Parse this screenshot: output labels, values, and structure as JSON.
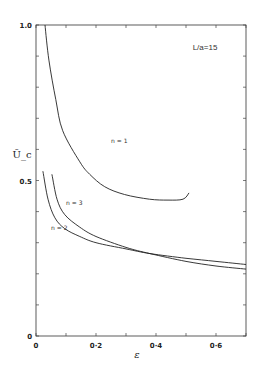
{
  "chart_data": {
    "type": "line",
    "title": "",
    "annotation": "L/a=15",
    "xlabel": "ε",
    "ylabel": "Ū_c",
    "xlim": [
      0,
      0.7
    ],
    "ylim": [
      0,
      1.0
    ],
    "grid": false,
    "legend": "inline curve labels",
    "x_ticks": [
      {
        "value": 0,
        "label": "0"
      },
      {
        "value": 0.2,
        "label": "0·2"
      },
      {
        "value": 0.4,
        "label": "0·4"
      },
      {
        "value": 0.6,
        "label": "0·6"
      }
    ],
    "y_ticks": [
      {
        "value": 0,
        "label": "0"
      },
      {
        "value": 0.5,
        "label": "0.5"
      },
      {
        "value": 1.0,
        "label": "1.0"
      }
    ],
    "series": [
      {
        "name": "n=1",
        "label": "n = 1",
        "label_pos": [
          0.25,
          0.62
        ],
        "x": [
          0.03,
          0.043,
          0.066,
          0.089,
          0.146,
          0.179,
          0.229,
          0.295,
          0.378,
          0.44,
          0.49,
          0.51
        ],
        "y": [
          1.0,
          0.887,
          0.76,
          0.66,
          0.56,
          0.52,
          0.48,
          0.455,
          0.44,
          0.437,
          0.44,
          0.46
        ]
      },
      {
        "name": "n=3",
        "label": "n = 3",
        "label_pos": [
          0.1,
          0.42
        ],
        "x": [
          0.053,
          0.07,
          0.096,
          0.146,
          0.2,
          0.3,
          0.38,
          0.5,
          0.6,
          0.7
        ],
        "y": [
          0.52,
          0.44,
          0.39,
          0.35,
          0.32,
          0.285,
          0.265,
          0.24,
          0.225,
          0.215
        ]
      },
      {
        "name": "n=2",
        "label": "n = 2",
        "label_pos": [
          0.05,
          0.34
        ],
        "x": [
          0.023,
          0.04,
          0.063,
          0.096,
          0.146,
          0.2,
          0.3,
          0.38,
          0.5,
          0.6,
          0.7
        ],
        "y": [
          0.53,
          0.44,
          0.38,
          0.345,
          0.32,
          0.3,
          0.28,
          0.265,
          0.25,
          0.24,
          0.23
        ]
      }
    ]
  }
}
